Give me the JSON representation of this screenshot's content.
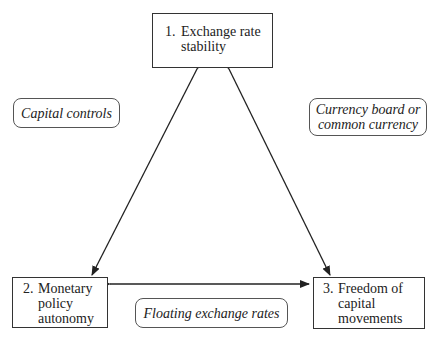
{
  "diagram": {
    "goals": [
      {
        "id": "exchange-rate-stability",
        "number": "1.",
        "lines": [
          "Exchange rate",
          "stability"
        ]
      },
      {
        "id": "monetary-policy-autonomy",
        "number": "2.",
        "lines": [
          "Monetary",
          "policy",
          "autonomy"
        ]
      },
      {
        "id": "freedom-of-capital-movements",
        "number": "3.",
        "lines": [
          "Freedom of",
          "capital",
          "movements"
        ]
      }
    ],
    "policies": [
      {
        "id": "capital-controls",
        "lines": [
          "Capital controls"
        ]
      },
      {
        "id": "currency-board",
        "lines": [
          "Currency board or",
          "common currency"
        ]
      },
      {
        "id": "floating-exchange-rates",
        "lines": [
          "Floating exchange rates"
        ]
      }
    ],
    "edges": [
      {
        "from": "exchange-rate-stability",
        "to": "monetary-policy-autonomy",
        "type": "double-arrow"
      },
      {
        "from": "exchange-rate-stability",
        "to": "freedom-of-capital-movements",
        "type": "double-arrow"
      },
      {
        "from": "monetary-policy-autonomy",
        "to": "freedom-of-capital-movements",
        "type": "double-arrow"
      }
    ],
    "colors": {
      "line": "#222222",
      "box_border": "#333333",
      "background": "#ffffff"
    }
  }
}
